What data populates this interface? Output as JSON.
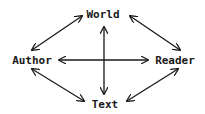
{
  "diagram": {
    "type": "relationship-diagram",
    "nodes": [
      {
        "id": "world",
        "label": "World",
        "x": 103,
        "y": 18
      },
      {
        "id": "author",
        "label": "Author",
        "x": 32,
        "y": 64
      },
      {
        "id": "reader",
        "label": "Reader",
        "x": 175,
        "y": 64
      },
      {
        "id": "text",
        "label": "Text",
        "x": 105,
        "y": 107
      }
    ],
    "edges": [
      {
        "from": "world",
        "to": "text",
        "style": "bidirectional"
      },
      {
        "from": "author",
        "to": "reader",
        "style": "bidirectional"
      },
      {
        "from": "author",
        "to": "world",
        "style": "bidirectional"
      },
      {
        "from": "world",
        "to": "reader",
        "style": "bidirectional"
      },
      {
        "from": "author",
        "to": "text",
        "style": "bidirectional"
      },
      {
        "from": "reader",
        "to": "text",
        "style": "bidirectional"
      }
    ],
    "colors": {
      "ink": "#1a1a1a",
      "background": "#ffffff"
    }
  }
}
